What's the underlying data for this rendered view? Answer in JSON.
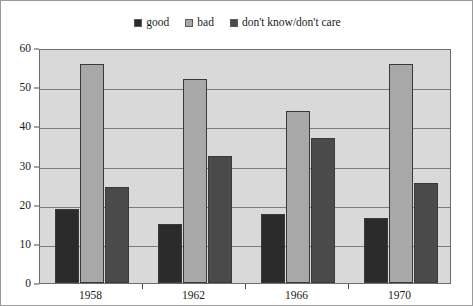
{
  "chart_data": {
    "type": "bar",
    "title": "",
    "subtitle": "",
    "xlabel": "",
    "ylabel": "",
    "categories": [
      "1958",
      "1962",
      "1966",
      "1970"
    ],
    "series": [
      {
        "name": "good",
        "color": "#2b2b2b",
        "values": [
          19,
          15,
          17.5,
          16.5
        ]
      },
      {
        "name": "bad",
        "color": "#a8a8a8",
        "values": [
          56,
          52,
          44,
          56
        ]
      },
      {
        "name": "don't know/don't care",
        "color": "#4a4a4a",
        "values": [
          24.5,
          32.5,
          37,
          25.5
        ]
      }
    ],
    "ylim": [
      0,
      60
    ],
    "y_ticks": [
      0,
      10,
      20,
      30,
      40,
      50,
      60
    ],
    "y_tick_labels": [
      "0",
      "10",
      "20",
      "30",
      "40",
      "50",
      "60"
    ],
    "grid": true,
    "grid_axis": "y",
    "legend_position": "top-center",
    "plot_background": "#d9d9d9",
    "figure_background": "#ffffff",
    "axis_color": "#6d6d6d",
    "gridline_color": "#7d7d7d"
  },
  "legend": {
    "entries": [
      {
        "label": "good",
        "color": "#2b2b2b"
      },
      {
        "label": "bad",
        "color": "#a8a8a8"
      },
      {
        "label": "don't know/don't care",
        "color": "#4a4a4a"
      }
    ]
  }
}
